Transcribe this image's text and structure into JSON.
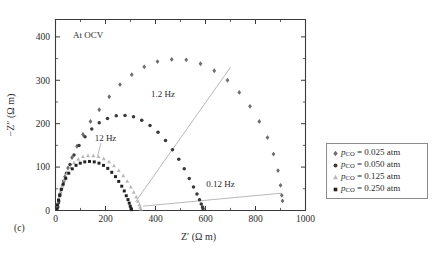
{
  "figure": {
    "panel_label": "(c)",
    "annotation_ocv": "At OCV"
  },
  "axes": {
    "x_title": "Z′ (Ω m)",
    "y_title": "−Z″ (Ω m)",
    "x_ticks": [
      "0",
      "200",
      "400",
      "600",
      "800",
      "1000"
    ],
    "y_ticks": [
      "0",
      "100",
      "200",
      "300",
      "400"
    ]
  },
  "annotations": [
    {
      "label": "12 Hz"
    },
    {
      "label": "1.2 Hz"
    },
    {
      "label": "0.12 Hz"
    }
  ],
  "legend": {
    "items": [
      {
        "marker": "diamond-marker",
        "symbol": "p",
        "subscript": "CO",
        "value": "= 0.025 atm",
        "color": "#6e6e6e"
      },
      {
        "marker": "circle-marker",
        "symbol": "p",
        "subscript": "CO",
        "value": "= 0.050 atm",
        "color": "#3a3a3a"
      },
      {
        "marker": "triangle-marker",
        "symbol": "p",
        "subscript": "CO",
        "value": "= 0.125 atm",
        "color": "#b8b8b8"
      },
      {
        "marker": "square-marker",
        "symbol": "p",
        "subscript": "CO",
        "value": "= 0.250 atm",
        "color": "#222222"
      }
    ]
  },
  "chart_data": {
    "type": "scatter",
    "title": "",
    "subtitle": "At OCV",
    "xlabel": "Z′ (Ω m)",
    "ylabel": "−Z″ (Ω m)",
    "xlim": [
      0,
      1000
    ],
    "ylim": [
      0,
      440
    ],
    "xticks": [
      0,
      200,
      400,
      600,
      800,
      1000
    ],
    "yticks": [
      0,
      100,
      200,
      300,
      400
    ],
    "grid": false,
    "legend_position": "right-outside",
    "annotations": [
      {
        "text": "At OCV",
        "x": 70,
        "y": 405
      },
      {
        "text": "12 Hz",
        "x": 200,
        "y": 160
      },
      {
        "text": "1.2 Hz",
        "x": 430,
        "y": 262
      },
      {
        "text": "0.12 Hz",
        "x": 660,
        "y": 55
      }
    ],
    "series": [
      {
        "name": "pCO = 0.025 atm",
        "marker": "diamond",
        "color": "#6e6e6e",
        "points": [
          [
            10,
            8
          ],
          [
            14,
            22
          ],
          [
            20,
            40
          ],
          [
            28,
            58
          ],
          [
            38,
            78
          ],
          [
            50,
            98
          ],
          [
            66,
            122
          ],
          [
            86,
            148
          ],
          [
            110,
            175
          ],
          [
            140,
            205
          ],
          [
            175,
            232
          ],
          [
            215,
            262
          ],
          [
            258,
            290
          ],
          [
            305,
            313
          ],
          [
            355,
            331
          ],
          [
            408,
            343
          ],
          [
            465,
            348
          ],
          [
            523,
            347
          ],
          [
            580,
            338
          ],
          [
            635,
            322
          ],
          [
            688,
            300
          ],
          [
            735,
            272
          ],
          [
            778,
            240
          ],
          [
            815,
            205
          ],
          [
            848,
            168
          ],
          [
            872,
            130
          ],
          [
            890,
            92
          ],
          [
            900,
            58
          ],
          [
            905,
            35
          ],
          [
            908,
            22
          ]
        ]
      },
      {
        "name": "pCO = 0.050 atm",
        "marker": "circle",
        "color": "#3a3a3a",
        "points": [
          [
            8,
            6
          ],
          [
            12,
            18
          ],
          [
            17,
            34
          ],
          [
            24,
            50
          ],
          [
            33,
            68
          ],
          [
            44,
            86
          ],
          [
            58,
            106
          ],
          [
            74,
            128
          ],
          [
            94,
            150
          ],
          [
            118,
            170
          ],
          [
            145,
            188
          ],
          [
            175,
            202
          ],
          [
            208,
            212
          ],
          [
            243,
            218
          ],
          [
            278,
            219
          ],
          [
            312,
            216
          ],
          [
            345,
            208
          ],
          [
            378,
            196
          ],
          [
            410,
            180
          ],
          [
            440,
            161
          ],
          [
            468,
            140
          ],
          [
            493,
            118
          ],
          [
            515,
            96
          ],
          [
            535,
            74
          ],
          [
            552,
            54
          ],
          [
            566,
            38
          ],
          [
            576,
            25
          ],
          [
            583,
            15
          ],
          [
            588,
            8
          ],
          [
            590,
            4
          ]
        ]
      },
      {
        "name": "pCO = 0.125 atm",
        "marker": "triangle",
        "color": "#b8b8b8",
        "points": [
          [
            6,
            5
          ],
          [
            9,
            15
          ],
          [
            13,
            27
          ],
          [
            19,
            41
          ],
          [
            26,
            55
          ],
          [
            35,
            70
          ],
          [
            46,
            85
          ],
          [
            59,
            99
          ],
          [
            74,
            110
          ],
          [
            91,
            118
          ],
          [
            110,
            124
          ],
          [
            130,
            126
          ],
          [
            151,
            126
          ],
          [
            172,
            124
          ],
          [
            193,
            119
          ],
          [
            214,
            112
          ],
          [
            234,
            103
          ],
          [
            253,
            92
          ],
          [
            271,
            80
          ],
          [
            287,
            67
          ],
          [
            301,
            54
          ],
          [
            313,
            42
          ],
          [
            323,
            31
          ],
          [
            330,
            21
          ],
          [
            336,
            13
          ],
          [
            339,
            7
          ],
          [
            341,
            3
          ]
        ]
      },
      {
        "name": "pCO = 0.250 atm",
        "marker": "square",
        "color": "#222222",
        "points": [
          [
            5,
            4
          ],
          [
            8,
            13
          ],
          [
            12,
            24
          ],
          [
            17,
            36
          ],
          [
            23,
            48
          ],
          [
            31,
            61
          ],
          [
            41,
            74
          ],
          [
            53,
            86
          ],
          [
            67,
            96
          ],
          [
            82,
            104
          ],
          [
            99,
            109
          ],
          [
            117,
            112
          ],
          [
            136,
            113
          ],
          [
            155,
            112
          ],
          [
            174,
            109
          ],
          [
            192,
            104
          ],
          [
            209,
            97
          ],
          [
            225,
            88
          ],
          [
            240,
            78
          ],
          [
            253,
            67
          ],
          [
            265,
            56
          ],
          [
            275,
            45
          ],
          [
            283,
            34
          ],
          [
            290,
            25
          ],
          [
            295,
            17
          ],
          [
            299,
            10
          ],
          [
            302,
            5
          ],
          [
            304,
            2
          ]
        ]
      }
    ]
  }
}
